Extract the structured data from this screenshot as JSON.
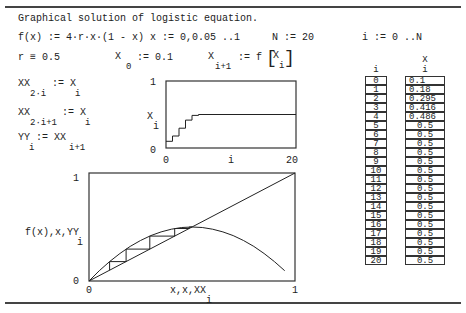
{
  "title": "Graphical solution of logistic equation.",
  "definitions": {
    "f_def": "f(x) := 4·r·x·(1 - x)",
    "x_range": "x := 0,0.05 ..1",
    "N_def": "N := 20",
    "i_range": "i := 0 ..N",
    "r_def": "r ≡ 0.5",
    "x0_main": "X",
    "x0_sub": "0",
    "x0_rhs": ":= 0.1",
    "xi1_main": "X",
    "xi1_sub": "i+1",
    "xi1_rhs": ":= f",
    "xi1_arg_main": "X",
    "xi1_arg_sub": "i",
    "xx2i_main": "XX",
    "xx2i_sub": "2·i",
    "xx2i_rhs": ":= X",
    "xx2i_rhs_sub": "i",
    "xx2i1_main": "XX",
    "xx2i1_sub": "2·i+1",
    "xx2i1_rhs": ":= X",
    "xx2i1_rhs_sub": "i",
    "yy_main": "YY",
    "yy_sub": "i",
    "yy_rhs": ":= XX",
    "yy_rhs_sub": "i+1"
  },
  "table": {
    "index_header": "i",
    "value_header_main": "X",
    "value_header_sub": "i",
    "rows": [
      {
        "i": "0",
        "x": "0.1"
      },
      {
        "i": "1",
        "x": "0.18"
      },
      {
        "i": "2",
        "x": "0.295"
      },
      {
        "i": "3",
        "x": "0.416"
      },
      {
        "i": "4",
        "x": "0.486"
      },
      {
        "i": "5",
        "x": "0.5"
      },
      {
        "i": "6",
        "x": "0.5"
      },
      {
        "i": "7",
        "x": "0.5"
      },
      {
        "i": "8",
        "x": "0.5"
      },
      {
        "i": "9",
        "x": "0.5"
      },
      {
        "i": "10",
        "x": "0.5"
      },
      {
        "i": "11",
        "x": "0.5"
      },
      {
        "i": "12",
        "x": "0.5"
      },
      {
        "i": "13",
        "x": "0.5"
      },
      {
        "i": "14",
        "x": "0.5"
      },
      {
        "i": "15",
        "x": "0.5"
      },
      {
        "i": "16",
        "x": "0.5"
      },
      {
        "i": "17",
        "x": "0.5"
      },
      {
        "i": "18",
        "x": "0.5"
      },
      {
        "i": "19",
        "x": "0.5"
      },
      {
        "i": "20",
        "x": "0.5"
      }
    ]
  },
  "chart_data": [
    {
      "type": "line",
      "title": "",
      "xlabel": "i",
      "ylabel": "X_i",
      "xlim": [
        0,
        20
      ],
      "ylim": [
        0,
        1
      ],
      "x_ticks": [
        "0",
        "20"
      ],
      "y_ticks": [
        "0",
        "1"
      ],
      "step": true,
      "series": [
        {
          "name": "X_i",
          "x": [
            0,
            1,
            2,
            3,
            4,
            5,
            6,
            7,
            8,
            9,
            10,
            11,
            12,
            13,
            14,
            15,
            16,
            17,
            18,
            19,
            20
          ],
          "values": [
            0.1,
            0.18,
            0.295,
            0.416,
            0.486,
            0.5,
            0.5,
            0.5,
            0.5,
            0.5,
            0.5,
            0.5,
            0.5,
            0.5,
            0.5,
            0.5,
            0.5,
            0.5,
            0.5,
            0.5,
            0.5
          ]
        }
      ]
    },
    {
      "type": "line",
      "title": "",
      "xlabel": "x,x,XX_i",
      "ylabel": "f(x),x,YY_i",
      "xlim": [
        0,
        1
      ],
      "ylim": [
        0,
        1
      ],
      "x_ticks": [
        "0",
        "1"
      ],
      "y_ticks": [
        "0",
        "1"
      ],
      "series": [
        {
          "name": "f(x)",
          "x": [
            0,
            0.05,
            0.1,
            0.15,
            0.2,
            0.25,
            0.3,
            0.35,
            0.4,
            0.45,
            0.5,
            0.55,
            0.6,
            0.65,
            0.7,
            0.75,
            0.8,
            0.85,
            0.9,
            0.95
          ],
          "values": [
            0,
            0.095,
            0.18,
            0.255,
            0.32,
            0.375,
            0.42,
            0.455,
            0.48,
            0.495,
            0.5,
            0.495,
            0.48,
            0.455,
            0.42,
            0.375,
            0.32,
            0.255,
            0.18,
            0.095
          ]
        },
        {
          "name": "x",
          "x": [
            0,
            1
          ],
          "values": [
            0,
            1
          ]
        },
        {
          "name": "cobweb YY vs XX",
          "x": [
            0.1,
            0.1,
            0.18,
            0.18,
            0.295,
            0.295,
            0.416,
            0.416,
            0.486,
            0.486,
            0.5
          ],
          "values": [
            0.1,
            0.18,
            0.18,
            0.295,
            0.295,
            0.416,
            0.416,
            0.486,
            0.486,
            0.5,
            0.5
          ]
        }
      ]
    }
  ]
}
